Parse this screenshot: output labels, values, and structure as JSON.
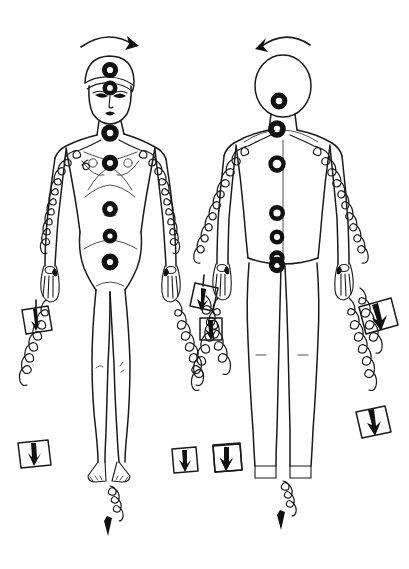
{
  "image": {
    "title": "Dual human figure energy-release diagram",
    "description": "Hand-drawn ink sketch of two standing human figures, front-view female on the left and featureless back-view figure on the right, annotated with filled chakra circles along the midline, spiral energy lines running down both arms and from the feet, and small square boxes containing downward arrows at the spiral ends.",
    "style": "hand-drawn ink line art",
    "background_color": "#ffffff",
    "ink_color": "#1a1a1a",
    "width": 409,
    "height": 569
  },
  "figures": [
    {
      "id": "figure-left",
      "label": "Front-view female figure",
      "view": "front",
      "has_facial_features": true,
      "facial_features": [
        "eyes",
        "nose",
        "mouth",
        "hair"
      ],
      "rotation_arrow": {
        "name": "clockwise-rotation-arrow",
        "direction": "clockwise",
        "position": "above head",
        "arrowhead_side": "right"
      },
      "chakra_points": [
        {
          "name": "crown-chakra",
          "position": "top of head",
          "radius": 6.5
        },
        {
          "name": "third-eye-chakra",
          "position": "forehead between eyebrows",
          "radius": 6.0
        },
        {
          "name": "throat-chakra",
          "position": "base of throat",
          "radius": 7.0
        },
        {
          "name": "heart-chakra",
          "position": "center of chest",
          "radius": 6.5
        },
        {
          "name": "solar-plexus-chakra",
          "position": "upper abdomen",
          "radius": 6.0
        },
        {
          "name": "sacral-chakra",
          "position": "lower abdomen",
          "radius": 5.5
        },
        {
          "name": "root-chakra",
          "position": "pelvis",
          "radius": 6.5
        }
      ],
      "energy_lines": [
        {
          "name": "left-arm-spiral",
          "path": "shoulder to hand along left arm",
          "loop_count": 9
        },
        {
          "name": "right-arm-spiral",
          "path": "shoulder to hand along right arm",
          "loop_count": 9
        },
        {
          "name": "left-hand-discharge-spiral",
          "path": "hand downward to box",
          "loop_count": 7
        },
        {
          "name": "right-hand-discharge-spiral",
          "path": "hand downward to box",
          "loop_count": 7
        },
        {
          "name": "feet-discharge-spiral",
          "path": "between feet downward to arrow",
          "loop_count": 4
        }
      ],
      "discharge_boxes": [
        {
          "name": "discharge-box-left-upper",
          "arrow": "down"
        },
        {
          "name": "discharge-box-left-lower",
          "arrow": "down"
        },
        {
          "name": "discharge-box-right-upper",
          "arrow": "down"
        },
        {
          "name": "discharge-box-right-lower",
          "arrow": "down"
        }
      ],
      "ground-arrow": {
        "name": "ground-arrow-feet",
        "direction": "down"
      }
    },
    {
      "id": "figure-right",
      "label": "Back-view featureless figure",
      "view": "back",
      "has_facial_features": false,
      "facial_features": [],
      "rotation_arrow": {
        "name": "counterclockwise-rotation-arrow",
        "direction": "counterclockwise",
        "position": "above head",
        "arrowhead_side": "left"
      },
      "chakra_points": [
        {
          "name": "occiput-chakra",
          "position": "back of head / base of skull",
          "radius": 6.5
        },
        {
          "name": "cervical-chakra",
          "position": "base of neck",
          "radius": 7.0
        },
        {
          "name": "upper-back-chakra",
          "position": "upper back between shoulder blades",
          "radius": 7.5
        },
        {
          "name": "mid-back-chakra",
          "position": "middle back",
          "radius": 6.5
        },
        {
          "name": "lower-back-chakra",
          "position": "lower back",
          "radius": 5.5
        },
        {
          "name": "sacrum-chakra",
          "position": "sacrum",
          "radius": 6.0
        },
        {
          "name": "base-chakra",
          "position": "base of spine / buttocks",
          "radius": 6.5
        }
      ],
      "energy_lines": [
        {
          "name": "left-arm-spiral",
          "path": "shoulder to hand along left arm",
          "loop_count": 10
        },
        {
          "name": "right-arm-spiral",
          "path": "shoulder to hand along right arm",
          "loop_count": 10
        },
        {
          "name": "left-hand-discharge-spiral",
          "path": "hand downward to box",
          "loop_count": 7
        },
        {
          "name": "right-hand-discharge-spiral",
          "path": "hand downward to box",
          "loop_count": 7
        },
        {
          "name": "feet-discharge-spiral",
          "path": "between feet downward to arrow",
          "loop_count": 4
        }
      ],
      "discharge_boxes": [
        {
          "name": "discharge-box-left-upper",
          "arrow": "down"
        },
        {
          "name": "discharge-box-left-lower",
          "arrow": "down"
        },
        {
          "name": "discharge-box-right-upper",
          "arrow": "down"
        },
        {
          "name": "discharge-box-right-lower",
          "arrow": "down"
        }
      ],
      "ground-arrow": {
        "name": "ground-arrow-feet",
        "direction": "down"
      }
    }
  ],
  "legend": {
    "chakra_symbol": "filled dark ring with light center",
    "energy_symbol": "looping spiral line",
    "discharge_symbol": "square box enclosing a downward arrow",
    "grounding_symbol": "spiral ending in downward arrow"
  }
}
